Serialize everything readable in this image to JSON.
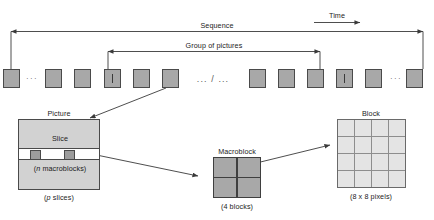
{
  "diagram": {
    "colors": {
      "frame_fill": "#a8a8a8",
      "frame_stroke": "#4a4a4a",
      "picture_fill": "#d2d2d2",
      "slice_fill": "#ffffff",
      "macroblock_fill": "#a8a8a8",
      "block_cell_fill": "#e4e4e4",
      "line": "#3a3a3a",
      "text": "#1b1b1b"
    }
  },
  "top": {
    "time_label": "Time",
    "sequence_label": "Sequence",
    "gop_label": "Group of pictures",
    "separator": "... / ...",
    "ellipsis": "···",
    "frame_i_glyph": "I",
    "frames": [
      {
        "index": 1,
        "type": "P",
        "label": ""
      },
      {
        "index": 2,
        "type": "P",
        "label": ""
      },
      {
        "index": 3,
        "type": "P",
        "label": ""
      },
      {
        "index": 4,
        "type": "I",
        "label": "I"
      },
      {
        "index": 5,
        "type": "P",
        "label": ""
      },
      {
        "index": 6,
        "type": "P",
        "label": ""
      },
      {
        "index": 7,
        "type": "P",
        "label": ""
      },
      {
        "index": 8,
        "type": "P",
        "label": ""
      },
      {
        "index": 9,
        "type": "P",
        "label": ""
      },
      {
        "index": 10,
        "type": "I",
        "label": "I"
      },
      {
        "index": 11,
        "type": "P",
        "label": ""
      },
      {
        "index": 12,
        "type": "P",
        "label": ""
      }
    ]
  },
  "picture": {
    "title": "Picture",
    "slice_label": "Slice",
    "macroblocks_note": "(n macroblocks)",
    "macroblocks_note_italic": "n",
    "slices_note": "(p slices)",
    "slices_note_italic": "p"
  },
  "macroblock": {
    "title": "Macroblock",
    "note": "(4 blocks)",
    "blocks": 4,
    "rows": 2,
    "cols": 2
  },
  "block": {
    "title": "Block",
    "note": "(8 x 8 pixels)",
    "rows": 8,
    "cols": 8
  }
}
